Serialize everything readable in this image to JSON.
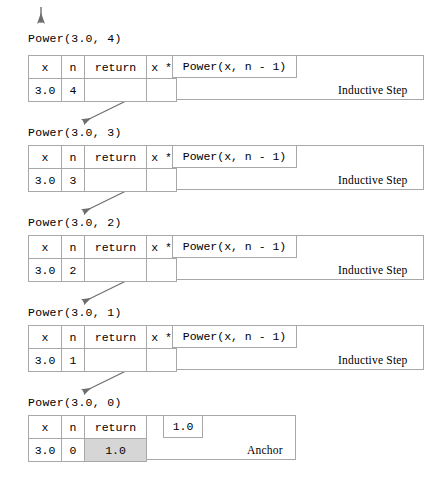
{
  "diagram": {
    "title_text": "Recursive trace of Power(3.0, 4)",
    "entry_arrow": "down-arrow",
    "columns": [
      "x",
      "n",
      "return"
    ],
    "operator_label": "x *",
    "recursive_call_label": "Power(x, n - 1)",
    "inductive_kind": "Inductive Step",
    "anchor_kind": "Anchor",
    "anchor_value_box": "1.0",
    "colors": {
      "border": "#a8a8a8",
      "shaded_cell": "#d6d6d6",
      "arrow": "#6e6e6e",
      "text": "#000000",
      "background": "#ffffff"
    },
    "frames": [
      {
        "call": "Power(3.0, 4)",
        "x": "3.0",
        "n": "4",
        "return": "",
        "operator": "x *",
        "recursive_call": "Power(x, n - 1)",
        "kind": "Inductive Step"
      },
      {
        "call": "Power(3.0, 3)",
        "x": "3.0",
        "n": "3",
        "return": "",
        "operator": "x *",
        "recursive_call": "Power(x, n - 1)",
        "kind": "Inductive Step"
      },
      {
        "call": "Power(3.0, 2)",
        "x": "3.0",
        "n": "2",
        "return": "",
        "operator": "x *",
        "recursive_call": "Power(x, n - 1)",
        "kind": "Inductive Step"
      },
      {
        "call": "Power(3.0, 1)",
        "x": "3.0",
        "n": "1",
        "return": "",
        "operator": "x *",
        "recursive_call": "Power(x, n - 1)",
        "kind": "Inductive Step"
      },
      {
        "call": "Power(3.0, 0)",
        "x": "3.0",
        "n": "0",
        "return": "1.0",
        "operator": "",
        "recursive_call": "1.0",
        "kind": "Anchor"
      }
    ]
  }
}
